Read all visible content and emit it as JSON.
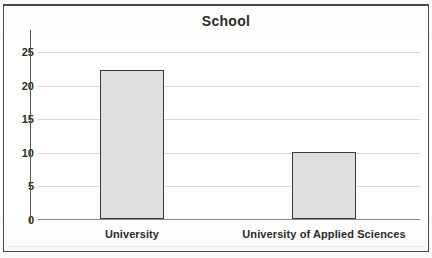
{
  "chart_data": {
    "type": "bar",
    "title": "School",
    "xlabel": "",
    "ylabel": "",
    "categories": [
      "University",
      "University of Applied Sciences"
    ],
    "values": [
      22.3,
      10.1
    ],
    "series": [
      {
        "name": "School",
        "values": [
          22.3,
          10.1
        ]
      }
    ],
    "ylim": [
      0,
      25
    ],
    "y_ticks": [
      0,
      5,
      10,
      15,
      20,
      25
    ],
    "y_tick_labels": [
      "0",
      "5",
      "10",
      "15",
      "20",
      "25"
    ],
    "grid": true,
    "grid_axis": "y",
    "legend": false,
    "legend_position": "none",
    "bar_fill_color": "#dedede",
    "bar_edge_color": "#3a3a3a",
    "gridline_color": "#d8d8d8",
    "text_color": "#2b2b2b",
    "background_color": "#ffffff",
    "frame": true
  },
  "figure": {
    "title": "School",
    "x_tick_labels": [
      "University",
      "University of Applied Sciences"
    ]
  }
}
